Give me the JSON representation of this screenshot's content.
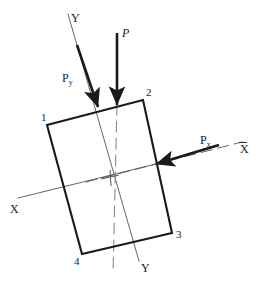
{
  "figure": {
    "canvas": {
      "width": 258,
      "height": 283,
      "background": "#ffffff"
    }
  },
  "colors": {
    "stroke_dark": "#1a1a1a",
    "stroke_thin": "#555555",
    "stroke_gray": "#8a8a8a",
    "text": "#1a1a1a",
    "background": "#ffffff"
  },
  "plate": {
    "name": "rectangular-plate",
    "stroke_width": 2.1,
    "vertices": [
      {
        "label": "1",
        "x": 47,
        "y": 125,
        "label_x": 41,
        "label_y": 121
      },
      {
        "label": "2",
        "x": 143,
        "y": 100,
        "label_x": 146,
        "label_y": 96
      },
      {
        "label": "3",
        "x": 172,
        "y": 233,
        "label_x": 176,
        "label_y": 238
      },
      {
        "label": "4",
        "x": 82,
        "y": 254,
        "label_x": 74,
        "label_y": 265
      }
    ]
  },
  "centroid": {
    "name": "centroid",
    "x": 110,
    "y": 177
  },
  "axes": [
    {
      "name": "x-axis-principal",
      "label": "X",
      "overbar": false,
      "x1": 18,
      "y1": 198,
      "x2": 160,
      "y2": 163,
      "label_x": 10,
      "label_y": 213,
      "stroke": "#555555",
      "stroke_width": 0.9,
      "dashed": false
    },
    {
      "name": "x-axis-centroidal",
      "label": "X",
      "overbar": true,
      "x1": 86,
      "y1": 182,
      "x2": 242,
      "y2": 142,
      "label_x": 240,
      "label_y": 153,
      "stroke": "#555555",
      "stroke_width": 0.9,
      "dashed": true
    },
    {
      "name": "y-axis-principal",
      "label": "Y",
      "overbar": false,
      "x1": 68,
      "y1": 14,
      "x2": 139,
      "y2": 261,
      "label_x": 141,
      "label_y": 272,
      "stroke": "#555555",
      "stroke_width": 0.9,
      "dashed": false
    },
    {
      "name": "y-axis-centroidal",
      "label": "Y",
      "overbar": true,
      "x1": 117,
      "y1": 104,
      "x2": 113,
      "y2": 273,
      "label_x": 0,
      "label_y": 0,
      "stroke": "#8a8a8a",
      "stroke_width": 1.1,
      "dashed": true
    }
  ],
  "axis_label_top_y": {
    "name": "y-axis-label-top",
    "text": "Y",
    "x": 71,
    "y": 22
  },
  "forces": [
    {
      "name": "force-arrow-P",
      "label": "P",
      "italic": true,
      "x1": 117,
      "y1": 33,
      "x2": 117,
      "y2": 105,
      "label_x": 122,
      "label_y": 37,
      "stroke_width": 2.6,
      "head_size": 6
    },
    {
      "name": "force-arrow-Py",
      "label": "P",
      "subscript": "y",
      "italic": false,
      "x1": 77,
      "y1": 45,
      "x2": 98,
      "y2": 107,
      "label_x": 62,
      "label_y": 82,
      "stroke_width": 2.6,
      "head_size": 6
    },
    {
      "name": "force-arrow-Px",
      "label": "P",
      "subscript": "x",
      "italic": false,
      "x1": 219,
      "y1": 145,
      "x2": 156,
      "y2": 164,
      "label_x": 200,
      "label_y": 144,
      "stroke_width": 2.6,
      "head_size": 6
    }
  ],
  "tick_marks": [
    {
      "name": "centroid-tick-vertical",
      "x1": 110,
      "y1": 170,
      "x2": 111,
      "y2": 186
    },
    {
      "name": "centroid-tick-horizontal",
      "x1": 101,
      "y1": 179,
      "x2": 119,
      "y2": 175
    }
  ]
}
